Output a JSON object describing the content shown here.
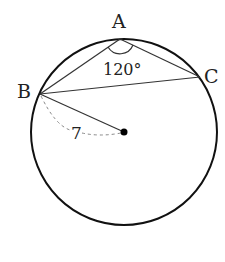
{
  "diagram": {
    "type": "circle-inscribed-triangle",
    "points": {
      "A": "A",
      "B": "B",
      "C": "C",
      "center": "O"
    },
    "angle_label": "120°",
    "angle_vertex": "A",
    "radius_label": "7",
    "colors": {
      "stroke": "#111111",
      "dashed": "#888888",
      "text": "#222222"
    }
  }
}
